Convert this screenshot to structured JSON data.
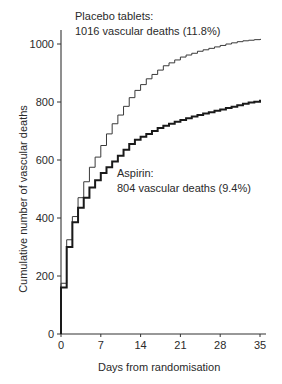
{
  "chart_data": {
    "type": "line",
    "step": true,
    "title": "",
    "xlabel": "Days from randomisation",
    "ylabel": "Cumulative number of vascular deaths",
    "xlim": [
      0,
      35
    ],
    "ylim": [
      0,
      1000
    ],
    "xticks": [
      0,
      7,
      14,
      21,
      28,
      35
    ],
    "yticks": [
      0,
      200,
      400,
      600,
      800,
      1000
    ],
    "grid": false,
    "legend": "inline annotations",
    "x": [
      0,
      1,
      2,
      3,
      4,
      5,
      6,
      7,
      8,
      9,
      10,
      11,
      12,
      13,
      14,
      15,
      16,
      17,
      18,
      19,
      20,
      21,
      22,
      23,
      24,
      25,
      26,
      27,
      28,
      29,
      30,
      31,
      32,
      33,
      34,
      35
    ],
    "series": [
      {
        "name": "Placebo tablets",
        "style": "thin",
        "values": [
          175,
          325,
          405,
          470,
          525,
          575,
          610,
          650,
          690,
          725,
          755,
          785,
          815,
          840,
          860,
          880,
          895,
          910,
          925,
          935,
          945,
          955,
          962,
          968,
          975,
          980,
          985,
          990,
          995,
          1000,
          1004,
          1008,
          1011,
          1013,
          1015,
          1016
        ]
      },
      {
        "name": "Aspirin",
        "style": "thick",
        "values": [
          160,
          300,
          385,
          435,
          470,
          505,
          530,
          555,
          575,
          595,
          615,
          635,
          655,
          670,
          680,
          690,
          700,
          710,
          718,
          725,
          732,
          738,
          744,
          750,
          755,
          760,
          765,
          770,
          774,
          779,
          784,
          789,
          794,
          798,
          801,
          804
        ]
      }
    ],
    "annotations": [
      {
        "series": "Placebo tablets",
        "line1": "Placebo tablets:",
        "line2": "1016 vascular deaths (11.8%)"
      },
      {
        "series": "Aspirin",
        "line1": "Aspirin:",
        "line2": "804 vascular deaths (9.4%)"
      }
    ]
  },
  "labels": {
    "placebo_line1": "Placebo tablets:",
    "placebo_line2": "1016 vascular deaths (11.8%)",
    "aspirin_line1": "Aspirin:",
    "aspirin_line2": "804 vascular deaths (9.4%)",
    "xlabel": "Days from randomisation",
    "ylabel": "Cumulative number of vascular deaths"
  }
}
